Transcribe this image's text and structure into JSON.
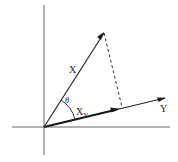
{
  "diagram": {
    "labels": {
      "x_vector": "X",
      "y_vector": "Y",
      "angle": "θ",
      "projection_main": "X",
      "projection_sub": "Y"
    },
    "colors": {
      "stroke": "#1a1a1a",
      "background": "#ffffff"
    }
  }
}
